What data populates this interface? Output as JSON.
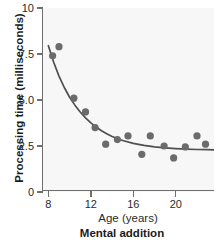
{
  "chart_data": {
    "type": "scatter",
    "title": "Mental addition",
    "xlabel": "Age (years)",
    "ylabel": "Processing time (milliseconds)",
    "xlim": [
      7.4,
      23.6
    ],
    "ylim": [
      0,
      10
    ],
    "grid": false,
    "legend": null,
    "xticks": [
      8,
      12,
      16,
      20
    ],
    "xtick_labels": [
      "8",
      "12",
      "16",
      "20"
    ],
    "yticks": [
      0,
      2.5,
      5.0,
      7.5,
      10
    ],
    "ytick_labels": [
      "0",
      "2.5",
      "5.0",
      "7.5",
      "10"
    ],
    "marker_color": "#6b6b6b",
    "curve_color": "#4f4f4f",
    "plot_background": "#f7f7f7",
    "points": [
      {
        "x": 8.4,
        "y": 7.4
      },
      {
        "x": 9.0,
        "y": 7.9
      },
      {
        "x": 10.4,
        "y": 5.1
      },
      {
        "x": 11.5,
        "y": 4.35
      },
      {
        "x": 12.4,
        "y": 3.5
      },
      {
        "x": 13.4,
        "y": 2.6
      },
      {
        "x": 14.5,
        "y": 2.85
      },
      {
        "x": 15.5,
        "y": 3.05
      },
      {
        "x": 16.8,
        "y": 2.05
      },
      {
        "x": 17.6,
        "y": 3.05
      },
      {
        "x": 18.9,
        "y": 2.5
      },
      {
        "x": 19.8,
        "y": 1.85
      },
      {
        "x": 20.9,
        "y": 2.45
      },
      {
        "x": 22.0,
        "y": 3.05
      },
      {
        "x": 22.8,
        "y": 2.6
      }
    ],
    "fit_curve": {
      "description": "decaying exponential fit approaching asymptote near 2.3 ms",
      "points": [
        {
          "x": 8.0,
          "y": 7.95
        },
        {
          "x": 8.5,
          "y": 7.05
        },
        {
          "x": 9.0,
          "y": 6.3
        },
        {
          "x": 9.5,
          "y": 5.68
        },
        {
          "x": 10.0,
          "y": 5.15
        },
        {
          "x": 10.5,
          "y": 4.72
        },
        {
          "x": 11.0,
          "y": 4.35
        },
        {
          "x": 11.5,
          "y": 4.03
        },
        {
          "x": 12.0,
          "y": 3.76
        },
        {
          "x": 12.5,
          "y": 3.53
        },
        {
          "x": 13.0,
          "y": 3.33
        },
        {
          "x": 13.5,
          "y": 3.17
        },
        {
          "x": 14.0,
          "y": 3.02
        },
        {
          "x": 15.0,
          "y": 2.8
        },
        {
          "x": 16.0,
          "y": 2.64
        },
        {
          "x": 17.0,
          "y": 2.53
        },
        {
          "x": 18.0,
          "y": 2.45
        },
        {
          "x": 19.0,
          "y": 2.4
        },
        {
          "x": 20.0,
          "y": 2.36
        },
        {
          "x": 21.0,
          "y": 2.33
        },
        {
          "x": 22.0,
          "y": 2.31
        },
        {
          "x": 23.0,
          "y": 2.3
        },
        {
          "x": 23.6,
          "y": 2.29
        }
      ]
    }
  }
}
